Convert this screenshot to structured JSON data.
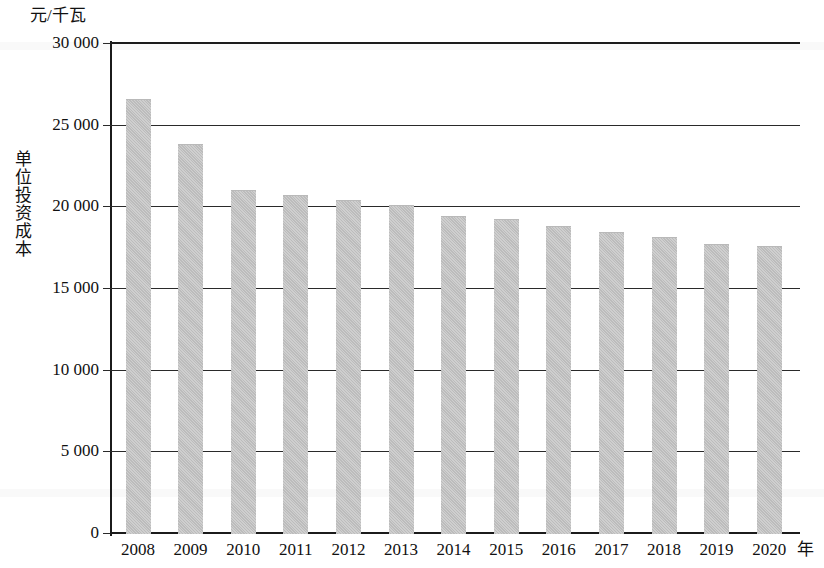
{
  "chart_data": {
    "type": "bar",
    "title": "",
    "subtitle": "",
    "unit_caption": "元/千瓦",
    "ylabel": "单位投资成本",
    "xlabel": "年",
    "categories": [
      "2008",
      "2009",
      "2010",
      "2011",
      "2012",
      "2013",
      "2014",
      "2015",
      "2016",
      "2017",
      "2018",
      "2019",
      "2020"
    ],
    "values": [
      26600,
      23800,
      21000,
      20700,
      20400,
      20100,
      19400,
      19200,
      18800,
      18400,
      18100,
      17700,
      17600
    ],
    "ylim": [
      0,
      30000
    ],
    "ytick_labels": [
      "0",
      "5 000",
      "10 000",
      "15 000",
      "20 000",
      "25 000",
      "30 000"
    ],
    "ytick_values": [
      0,
      5000,
      10000,
      15000,
      20000,
      25000,
      30000
    ],
    "grid": "horizontal",
    "legend": "none",
    "series": [
      {
        "name": "单位投资成本",
        "color": "#c2c2c2",
        "values": [
          26600,
          23800,
          21000,
          20700,
          20400,
          20100,
          19400,
          19200,
          18800,
          18400,
          18100,
          17700,
          17600
        ]
      }
    ]
  },
  "colors": {
    "bar": "#c2c2c2",
    "axis": "#1b1b1b",
    "grid": "#2a2a2a",
    "text": "#111111",
    "background": "#ffffff"
  }
}
